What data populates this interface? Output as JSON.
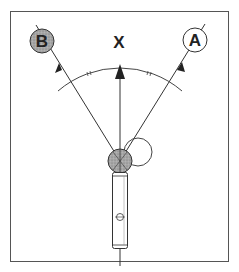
{
  "diagram": {
    "labels": {
      "center": "X",
      "left": "B",
      "right": "A"
    },
    "colors": {
      "frame": "#555555",
      "line": "#333333",
      "gray_fill": "#9a9a9a",
      "white_fill": "#ffffff"
    }
  }
}
